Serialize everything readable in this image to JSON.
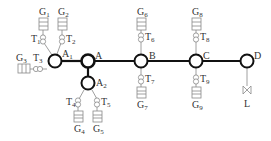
{
  "diagram": {
    "type": "power-network-one-line",
    "colors": {
      "bus_line": "#111111",
      "branch_line": "#888888",
      "label": "#333333",
      "background": "#ffffff"
    },
    "nodes": [
      {
        "id": "A1",
        "label": "A",
        "sub": "1"
      },
      {
        "id": "A",
        "label": "A",
        "sub": ""
      },
      {
        "id": "A2",
        "label": "A",
        "sub": "2"
      },
      {
        "id": "B",
        "label": "B",
        "sub": ""
      },
      {
        "id": "C",
        "label": "C",
        "sub": ""
      },
      {
        "id": "D",
        "label": "D",
        "sub": ""
      }
    ],
    "generators": [
      {
        "id": "G1",
        "label": "G",
        "sub": "1"
      },
      {
        "id": "G2",
        "label": "G",
        "sub": "2"
      },
      {
        "id": "G3",
        "label": "G",
        "sub": "3"
      },
      {
        "id": "G4",
        "label": "G",
        "sub": "4"
      },
      {
        "id": "G5",
        "label": "G",
        "sub": "5"
      },
      {
        "id": "G6",
        "label": "G",
        "sub": "6"
      },
      {
        "id": "G7",
        "label": "G",
        "sub": "7"
      },
      {
        "id": "G8",
        "label": "G",
        "sub": "8"
      },
      {
        "id": "G9",
        "label": "G",
        "sub": "9"
      }
    ],
    "transformers": [
      {
        "id": "T1",
        "label": "T",
        "sub": "1"
      },
      {
        "id": "T2",
        "label": "T",
        "sub": "2"
      },
      {
        "id": "T3",
        "label": "T",
        "sub": "3"
      },
      {
        "id": "T4",
        "label": "T",
        "sub": "4"
      },
      {
        "id": "T5",
        "label": "T",
        "sub": "5"
      },
      {
        "id": "T6",
        "label": "T",
        "sub": "6"
      },
      {
        "id": "T7",
        "label": "T",
        "sub": "7"
      },
      {
        "id": "T8",
        "label": "T",
        "sub": "8"
      },
      {
        "id": "T9",
        "label": "T",
        "sub": "9"
      }
    ],
    "load": {
      "id": "L",
      "label": "L"
    },
    "edges": [
      [
        "A1",
        "A"
      ],
      [
        "A",
        "B"
      ],
      [
        "B",
        "C"
      ],
      [
        "C",
        "D"
      ],
      [
        "A",
        "A2"
      ],
      [
        "G1",
        "T1"
      ],
      [
        "T1",
        "A1"
      ],
      [
        "G2",
        "T2"
      ],
      [
        "T2",
        "A1"
      ],
      [
        "G3",
        "T3"
      ],
      [
        "T3",
        "A1"
      ],
      [
        "A2",
        "T4"
      ],
      [
        "T4",
        "G4"
      ],
      [
        "A2",
        "T5"
      ],
      [
        "T5",
        "G5"
      ],
      [
        "G6",
        "T6"
      ],
      [
        "T6",
        "B"
      ],
      [
        "B",
        "T7"
      ],
      [
        "T7",
        "G7"
      ],
      [
        "G8",
        "T8"
      ],
      [
        "T8",
        "C"
      ],
      [
        "C",
        "T9"
      ],
      [
        "T9",
        "G9"
      ],
      [
        "D",
        "L"
      ]
    ]
  }
}
